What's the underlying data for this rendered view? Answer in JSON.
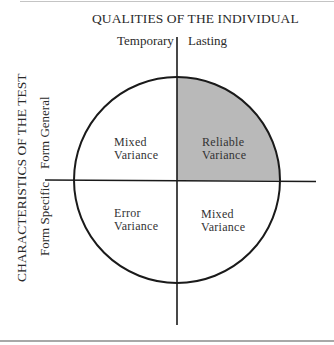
{
  "diagram": {
    "top_axis": {
      "title": "QUALITIES OF THE INDIVIDUAL",
      "left_label": "Temporary",
      "right_label": "Lasting"
    },
    "left_axis": {
      "title": "CHARACTERISTICS OF THE TEST",
      "upper_label": "Form General",
      "lower_label": "Form Specific"
    },
    "quadrants": {
      "upper_left": {
        "line1": "Mixed",
        "line2": "Variance",
        "shaded": false
      },
      "upper_right": {
        "line1": "Reliable",
        "line2": "Variance",
        "shaded": true
      },
      "lower_left": {
        "line1": "Error",
        "line2": "Variance",
        "shaded": false
      },
      "lower_right": {
        "line1": "Mixed",
        "line2": "Variance",
        "shaded": false
      }
    },
    "colors": {
      "shade": "#b9b9b9",
      "stroke": "#1a1a1a"
    }
  }
}
